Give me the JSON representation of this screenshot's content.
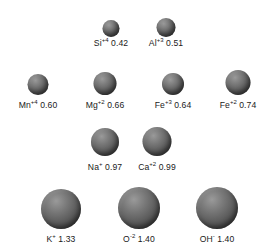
{
  "figure": {
    "background_color": "#ffffff",
    "sphere_color": "#5e5e5e",
    "text_color": "#1a1a1a",
    "units": "angstroms"
  },
  "chart_data": {
    "type": "scatter",
    "title": "",
    "xlabel": "",
    "ylabel": "",
    "note": "Spheres drawn to scale; diameter proportional to ionic radius value",
    "categories": [
      "Si+4",
      "Al+3",
      "Mn+4",
      "Mg+2",
      "Fe+3",
      "Fe+2",
      "Na+",
      "Ca+2",
      "K+",
      "O-2",
      "OH-"
    ],
    "values": [
      0.42,
      0.51,
      0.6,
      0.66,
      0.64,
      0.74,
      0.97,
      0.99,
      1.33,
      1.4,
      1.4
    ]
  },
  "ions": [
    {
      "id": "si",
      "element": "Si",
      "charge": "+4",
      "radius": "0.42",
      "cx": 111,
      "cy": 20,
      "d": 17,
      "label_y": 37
    },
    {
      "id": "al",
      "element": "Al",
      "charge": "+3",
      "radius": "0.51",
      "cx": 166,
      "cy": 18,
      "d": 19,
      "label_y": 37
    },
    {
      "id": "mn",
      "element": "Mn",
      "charge": "+4",
      "radius": "0.60",
      "cx": 38,
      "cy": 74,
      "d": 21,
      "label_y": 99
    },
    {
      "id": "mg",
      "element": "Mg",
      "charge": "+2",
      "radius": "0.66",
      "cx": 105,
      "cy": 72,
      "d": 23,
      "label_y": 99
    },
    {
      "id": "fe3",
      "element": "Fe",
      "charge": "+3",
      "radius": "0.64",
      "cx": 173,
      "cy": 73,
      "d": 22,
      "label_y": 99
    },
    {
      "id": "fe2",
      "element": "Fe",
      "charge": "+2",
      "radius": "0.74",
      "cx": 238,
      "cy": 70,
      "d": 25,
      "label_y": 99
    },
    {
      "id": "na",
      "element": "Na",
      "charge": "+",
      "radius": "0.97",
      "cx": 105,
      "cy": 128,
      "d": 28,
      "label_y": 161
    },
    {
      "id": "ca",
      "element": "Ca",
      "charge": "+2",
      "radius": "0.99",
      "cx": 157,
      "cy": 127,
      "d": 29,
      "label_y": 161
    },
    {
      "id": "k",
      "element": "K",
      "charge": "+",
      "radius": "1.33",
      "cx": 61,
      "cy": 189,
      "d": 40,
      "label_y": 233
    },
    {
      "id": "o",
      "element": "O",
      "charge": "-2",
      "radius": "1.40",
      "cx": 139,
      "cy": 187,
      "d": 42,
      "label_y": 233
    },
    {
      "id": "oh",
      "element": "OH",
      "charge": "-",
      "radius": "1.40",
      "cx": 217,
      "cy": 187,
      "d": 42,
      "label_y": 233
    }
  ]
}
